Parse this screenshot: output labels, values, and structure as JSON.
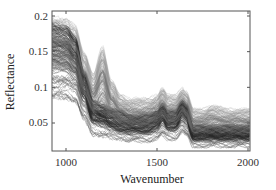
{
  "chart_data": {
    "type": "line",
    "title": "",
    "xlabel": "Wavenumber",
    "ylabel": "Reflectance",
    "xlim": [
      922,
      2010
    ],
    "ylim": [
      0.01,
      0.207
    ],
    "xticks": [
      1000,
      1500,
      2000
    ],
    "xtick_labels": [
      "1000",
      "1500",
      "2000"
    ],
    "yticks": [
      0.05,
      0.1,
      0.15,
      0.2
    ],
    "ytick_labels": [
      "0.05",
      "0.1",
      "0.15",
      "0.2"
    ],
    "grid": false,
    "legend": null,
    "series_envelope": {
      "x": [
        922,
        1000,
        1050,
        1100,
        1150,
        1200,
        1250,
        1300,
        1350,
        1400,
        1450,
        1500,
        1530,
        1560,
        1600,
        1640,
        1660,
        1700,
        1750,
        1800,
        1900,
        2000
      ],
      "upper": [
        0.2,
        0.198,
        0.19,
        0.15,
        0.12,
        0.16,
        0.11,
        0.09,
        0.085,
        0.085,
        0.085,
        0.09,
        0.1,
        0.09,
        0.09,
        0.1,
        0.095,
        0.07,
        0.07,
        0.075,
        0.07,
        0.07
      ],
      "core_upper": [
        0.19,
        0.185,
        0.17,
        0.12,
        0.08,
        0.075,
        0.07,
        0.065,
        0.06,
        0.06,
        0.06,
        0.065,
        0.075,
        0.065,
        0.065,
        0.08,
        0.075,
        0.045,
        0.045,
        0.045,
        0.045,
        0.045
      ],
      "core_lower": [
        0.12,
        0.12,
        0.11,
        0.08,
        0.05,
        0.045,
        0.04,
        0.035,
        0.035,
        0.035,
        0.035,
        0.04,
        0.05,
        0.04,
        0.04,
        0.055,
        0.05,
        0.025,
        0.025,
        0.025,
        0.025,
        0.025
      ],
      "lower": [
        0.08,
        0.08,
        0.075,
        0.05,
        0.03,
        0.025,
        0.025,
        0.025,
        0.022,
        0.022,
        0.022,
        0.025,
        0.03,
        0.025,
        0.025,
        0.035,
        0.03,
        0.015,
        0.015,
        0.015,
        0.015,
        0.015
      ]
    }
  },
  "labels": {
    "xlabel": "Wavenumber",
    "ylabel": "Reflectance",
    "xticks": [
      "1000",
      "1500",
      "2000"
    ],
    "yticks": [
      "0.05",
      "0.1",
      "0.15",
      "0.2"
    ]
  }
}
